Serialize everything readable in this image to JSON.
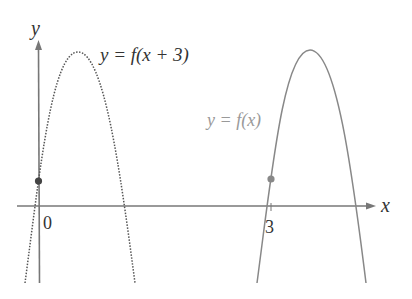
{
  "diagram": {
    "axes": {
      "x_label": "x",
      "y_label": "y",
      "origin_label": "0",
      "tick_label_3": "3"
    },
    "curves": [
      {
        "name": "shifted",
        "label": "y = f(x + 3)",
        "style": "dotted",
        "color": "#555555"
      },
      {
        "name": "original",
        "label": "y = f(x)",
        "style": "solid",
        "color": "#777777"
      }
    ],
    "points": [
      {
        "name": "y-intercept-shifted",
        "color": "#444444"
      },
      {
        "name": "point-at-x3",
        "color": "#888888"
      }
    ]
  }
}
